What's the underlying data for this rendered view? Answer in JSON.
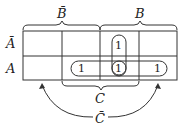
{
  "diagram": {
    "type": "karnaugh-map",
    "column_groups": [
      {
        "label": "B̄",
        "name": "not-b"
      },
      {
        "label": "B",
        "name": "b"
      }
    ],
    "row_labels": [
      "Ā",
      "A"
    ],
    "bottom_labels": {
      "c": "C",
      "c_bar": "C̄"
    },
    "cells": [
      [
        "",
        "",
        "1",
        ""
      ],
      [
        "",
        "1",
        "1",
        "1"
      ]
    ],
    "groupings": [
      {
        "name": "vertical-group",
        "cells": [
          [
            0,
            2
          ],
          [
            1,
            2
          ]
        ]
      },
      {
        "name": "horizontal-group",
        "cells": [
          [
            1,
            1
          ],
          [
            1,
            2
          ],
          [
            1,
            3
          ]
        ]
      },
      {
        "name": "single-group",
        "cells": [
          [
            1,
            2
          ]
        ]
      }
    ]
  }
}
